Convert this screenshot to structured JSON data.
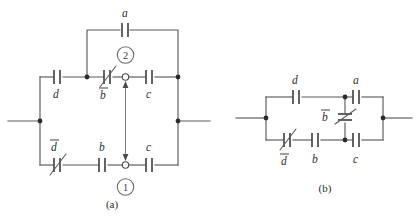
{
  "figure": {
    "background_color": "#ffffff",
    "wire_color": "#5a5a5a",
    "plate_color": "#3d3d3d",
    "label_color": "#2e2e2e",
    "panels": [
      {
        "id": "panel-a",
        "caption": "(a)",
        "node_markers": [
          "2",
          "1"
        ],
        "components": [
          {
            "name": "cap-a-top",
            "label": "a",
            "overbar": false,
            "variable": false,
            "orientation": "horizontal"
          },
          {
            "name": "cap-d-upper",
            "label": "d",
            "overbar": false,
            "variable": false,
            "orientation": "horizontal"
          },
          {
            "name": "cap-bbar-upper",
            "label": "b",
            "overbar": true,
            "variable": true,
            "orientation": "horizontal"
          },
          {
            "name": "cap-c-upper",
            "label": "c",
            "overbar": false,
            "variable": false,
            "orientation": "horizontal"
          },
          {
            "name": "cap-dbar-lower",
            "label": "d",
            "overbar": true,
            "variable": true,
            "orientation": "horizontal"
          },
          {
            "name": "cap-b-lower",
            "label": "b",
            "overbar": false,
            "variable": false,
            "orientation": "horizontal"
          },
          {
            "name": "cap-c-lower",
            "label": "c",
            "overbar": false,
            "variable": false,
            "orientation": "horizontal"
          }
        ]
      },
      {
        "id": "panel-b",
        "caption": "(b)",
        "node_markers": [],
        "components": [
          {
            "name": "cap-d",
            "label": "d",
            "overbar": false,
            "variable": false,
            "orientation": "horizontal"
          },
          {
            "name": "cap-a",
            "label": "a",
            "overbar": false,
            "variable": false,
            "orientation": "horizontal"
          },
          {
            "name": "cap-bbar",
            "label": "b",
            "overbar": true,
            "variable": true,
            "orientation": "vertical"
          },
          {
            "name": "cap-dbar",
            "label": "d",
            "overbar": true,
            "variable": true,
            "orientation": "horizontal"
          },
          {
            "name": "cap-b",
            "label": "b",
            "overbar": false,
            "variable": false,
            "orientation": "horizontal"
          },
          {
            "name": "cap-c",
            "label": "c",
            "overbar": false,
            "variable": false,
            "orientation": "horizontal"
          }
        ]
      }
    ],
    "labels": {
      "a_top": "a",
      "d_upper": "d",
      "b_upper": "b",
      "c_upper": "c",
      "d_lower": "d",
      "b_lower": "b",
      "c_lower": "c",
      "node_2": "2",
      "node_1": "1",
      "caption_a": "(a)",
      "b_d": "d",
      "b_a": "a",
      "b_bbar": "b",
      "b_dbar": "d",
      "b_b": "b",
      "b_c": "c",
      "caption_b": "(b)"
    }
  }
}
